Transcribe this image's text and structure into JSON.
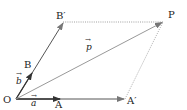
{
  "diagram": {
    "type": "vector-parallelogram",
    "points": {
      "O": {
        "label": "O",
        "x": 16,
        "y": 99
      },
      "A": {
        "label": "A",
        "x": 60,
        "y": 99
      },
      "A_prime": {
        "label": "A′",
        "x": 125,
        "y": 99
      },
      "B": {
        "label": "B",
        "x": 32,
        "y": 73
      },
      "B_prime": {
        "label": "B′",
        "x": 63,
        "y": 22
      },
      "P": {
        "label": "P",
        "x": 163,
        "y": 22
      }
    },
    "vectors": {
      "a": {
        "label": "a",
        "from": "O",
        "to": "A"
      },
      "b": {
        "label": "b",
        "from": "O",
        "to": "B"
      },
      "p": {
        "label": "p",
        "from": "O",
        "to": "P"
      }
    },
    "edges": [
      {
        "from": "O",
        "to": "A_prime",
        "style": "solid"
      },
      {
        "from": "O",
        "to": "B_prime",
        "style": "solid"
      },
      {
        "from": "O",
        "to": "P",
        "style": "solid-light"
      },
      {
        "from": "B_prime",
        "to": "P",
        "style": "dotted"
      },
      {
        "from": "A_prime",
        "to": "P",
        "style": "dotted"
      }
    ],
    "colors": {
      "line": "#555555",
      "light_line": "#999999",
      "dotted": "#888888",
      "text": "#222222"
    }
  }
}
